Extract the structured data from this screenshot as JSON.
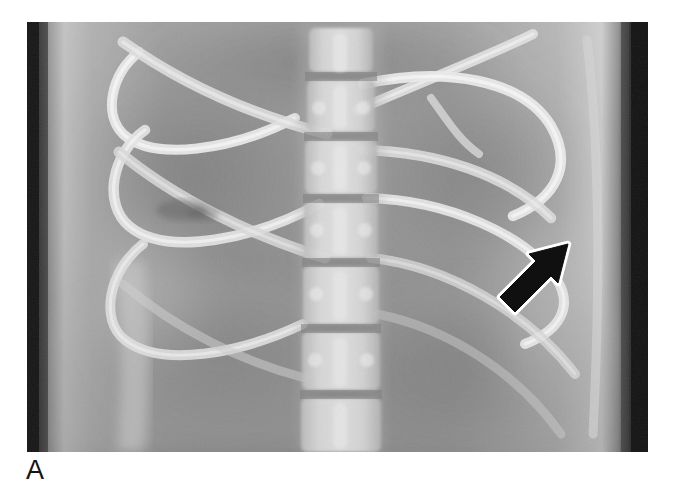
{
  "figure": {
    "panel_label": "A",
    "modality": "radiograph",
    "view": "anteroposterior",
    "body_region": "thoracolumbar spine and lower chest",
    "background_color": "#ffffff",
    "image_bounds": {
      "x": 27,
      "y": 22,
      "width": 621,
      "height": 430
    },
    "tones": {
      "film_base": "#9c9c9c",
      "soft_tissue": "#a2a2a2",
      "lung_field": "#8d8d8d",
      "bone_bright": "#e8e8e8",
      "bone_mid": "#cfcfcf",
      "collimation_dark": "#1d1d1d",
      "lesion_dark": "#6f6f6f",
      "paper_white": "#ffffff"
    },
    "annotation": {
      "type": "arrow",
      "label": "arrow-marker",
      "direction": "up-right",
      "fill_color": "#101010",
      "outline_color": "#ffffff",
      "tip": {
        "x": 535,
        "y": 226
      },
      "tail": {
        "x": 472,
        "y": 281
      },
      "points_at": "left lateral rib lesion"
    },
    "structures": [
      {
        "name": "thoracolumbar-spine",
        "description": "central vertebral column with stacked vertebral bodies and disc spaces"
      },
      {
        "name": "vertebral-bodies",
        "count": 7
      },
      {
        "name": "left-ribs",
        "count": 6,
        "description": "bright curved ribs descending from upper left toward midline"
      },
      {
        "name": "right-ribs",
        "count": 6,
        "description": "bright curved ribs descending from upper right toward midline"
      },
      {
        "name": "costal-cartilage",
        "description": "rib ends curving anteriorly at right upper quadrant"
      },
      {
        "name": "diaphragm-shadow",
        "description": "soft tissue density across mid-abdomen"
      },
      {
        "name": "flank-stripe",
        "description": "lighter vertical band at left abdominal wall"
      },
      {
        "name": "rib-lesion",
        "description": "lucent defect within a left posterior rib"
      },
      {
        "name": "collimation-band-left",
        "description": "dark vertical exposure border at left image edge"
      },
      {
        "name": "collimation-band-right",
        "description": "dark vertical exposure border at right image edge"
      }
    ]
  }
}
